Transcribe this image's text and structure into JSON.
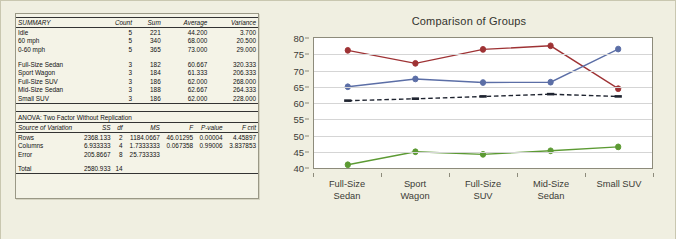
{
  "summary": {
    "title": "SUMMARY",
    "columns": [
      "SUMMARY",
      "Count",
      "Sum",
      "Average",
      "Variance"
    ],
    "group_a": [
      {
        "label": "Idle",
        "count": "5",
        "sum": "221",
        "average": "44.200",
        "variance": "3.700"
      },
      {
        "label": "60 mph",
        "count": "5",
        "sum": "340",
        "average": "68.000",
        "variance": "20.500"
      },
      {
        "label": "0-60 mph",
        "count": "5",
        "sum": "365",
        "average": "73.000",
        "variance": "29.000"
      }
    ],
    "group_b": [
      {
        "label": "Full-Size Sedan",
        "count": "3",
        "sum": "182",
        "average": "60.667",
        "variance": "320.333"
      },
      {
        "label": "Sport Wagon",
        "count": "3",
        "sum": "184",
        "average": "61.333",
        "variance": "206.333"
      },
      {
        "label": "Full-Size SUV",
        "count": "3",
        "sum": "186",
        "average": "62.000",
        "variance": "268.000"
      },
      {
        "label": "Mid-Size Sedan",
        "count": "3",
        "sum": "188",
        "average": "62.667",
        "variance": "264.333"
      },
      {
        "label": "Small SUV",
        "count": "3",
        "sum": "186",
        "average": "62.000",
        "variance": "228.000"
      }
    ]
  },
  "anova": {
    "title": "ANOVA: Two Factor Without Replication",
    "columns": [
      "Source of Variation",
      "SS",
      "df",
      "MS",
      "F",
      "P-value",
      "F crit"
    ],
    "rows": [
      {
        "source": "Rows",
        "ss": "2368.133",
        "df": "2",
        "ms": "1184.0667",
        "f": "46.01295",
        "p": "0.00004",
        "fcrit": "4.45897"
      },
      {
        "source": "Columns",
        "ss": "6.933333",
        "df": "4",
        "ms": "1.7333333",
        "f": "0.067358",
        "p": "0.99006",
        "fcrit": "3.837853"
      },
      {
        "source": "Error",
        "ss": "205.8667",
        "df": "8",
        "ms": "25.733333",
        "f": "",
        "p": "",
        "fcrit": ""
      }
    ],
    "total": {
      "source": "Total",
      "ss": "2580.933",
      "df": "14",
      "ms": "",
      "f": "",
      "p": "",
      "fcrit": ""
    }
  },
  "chart_data": {
    "type": "line",
    "title": "Comparison of Groups",
    "xlabel": "",
    "ylabel": "",
    "ylim": [
      40,
      80
    ],
    "ytick_step": 5,
    "yticks": [
      80,
      75,
      70,
      65,
      60,
      55,
      50,
      45,
      40
    ],
    "grid": true,
    "legend": "none",
    "categories": [
      "Full-Size\nSedan",
      "Sport\nWagon",
      "Full-Size\nSUV",
      "Mid-Size\nSedan",
      "Small SUV"
    ],
    "category_lines": [
      [
        "Full-Size",
        "Sedan"
      ],
      [
        "Sport",
        "Wagon"
      ],
      [
        "Full-Size",
        "SUV"
      ],
      [
        "Mid-Size",
        "Sedan"
      ],
      [
        "Small SUV"
      ]
    ],
    "series": [
      {
        "name": "0-60 mph",
        "color": "#9e3234",
        "style": "solid",
        "marker": "circle",
        "values": [
          76.2,
          72.2,
          76.5,
          77.6,
          64.4
        ]
      },
      {
        "name": "60 mph",
        "color": "#5b6ea6",
        "style": "solid",
        "marker": "circle",
        "values": [
          65.0,
          67.4,
          66.3,
          66.4,
          76.6
        ]
      },
      {
        "name": "Average",
        "color": "#1f2430",
        "style": "dashed",
        "marker": "dash",
        "values": [
          60.7,
          61.3,
          62.0,
          62.7,
          62.0
        ]
      },
      {
        "name": "Idle",
        "color": "#5c9a33",
        "style": "solid",
        "marker": "circle",
        "values": [
          41.0,
          45.0,
          44.2,
          45.3,
          46.5
        ]
      }
    ]
  }
}
